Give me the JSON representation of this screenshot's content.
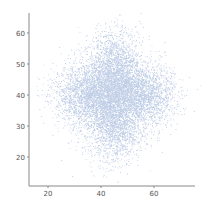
{
  "chart_data": {
    "type": "scatter",
    "title": "",
    "xlabel": "",
    "ylabel": "",
    "xlim": [
      13,
      75
    ],
    "ylim": [
      9,
      65
    ],
    "x_ticks": [
      20,
      40,
      60
    ],
    "y_ticks": [
      20,
      30,
      40,
      50,
      60
    ],
    "x_tick_labels": [
      "20",
      "40",
      "60"
    ],
    "y_tick_labels": [
      "20",
      "30",
      "40",
      "50",
      "60"
    ],
    "grid": false,
    "legend": null,
    "point_color": "#4a72b8",
    "point_alpha": 0.35,
    "point_count": 9000,
    "clusters": [
      {
        "cx": 45,
        "cy": 48,
        "sx": 5.5,
        "sy": 6.5,
        "weight": 0.25
      },
      {
        "cx": 45,
        "cy": 32,
        "sx": 5.5,
        "sy": 6.5,
        "weight": 0.25
      },
      {
        "cx": 35,
        "cy": 40,
        "sx": 6.5,
        "sy": 5.0,
        "weight": 0.25
      },
      {
        "cx": 55,
        "cy": 40,
        "sx": 6.5,
        "sy": 5.0,
        "weight": 0.25
      }
    ]
  },
  "layout": {
    "plot_left": 29,
    "plot_right": 195,
    "plot_top": 13,
    "plot_bottom": 186,
    "x_px_per_unit": 2.65,
    "x_origin_value": 20,
    "x_origin_px": 48,
    "y_px_per_unit": 3.1,
    "y_origin_value": 40,
    "y_origin_px": 95
  }
}
